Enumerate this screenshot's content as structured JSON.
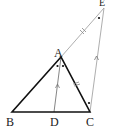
{
  "diagram": {
    "labels": {
      "A": "A",
      "B": "B",
      "C": "C",
      "D": "D",
      "E": "E"
    },
    "points": {
      "A": [
        61,
        57
      ],
      "B": [
        12,
        112
      ],
      "C": [
        90,
        112
      ],
      "D": [
        54,
        112
      ],
      "E": [
        104,
        8
      ]
    },
    "segments": [
      {
        "from": "A",
        "to": "B",
        "style": "thick"
      },
      {
        "from": "A",
        "to": "C",
        "style": "thick"
      },
      {
        "from": "B",
        "to": "C",
        "style": "thick"
      },
      {
        "from": "A",
        "to": "D",
        "style": "thin"
      },
      {
        "from": "A",
        "to": "E",
        "style": "thin"
      },
      {
        "from": "C",
        "to": "E",
        "style": "thin"
      }
    ],
    "marks": {
      "equal_length": [
        "AE",
        "AC"
      ],
      "parallel": [
        "AD",
        "EC"
      ],
      "equal_angles_dots": [
        "angle BAD",
        "angle DAC",
        "angle AEC",
        "angle ACE"
      ]
    }
  }
}
